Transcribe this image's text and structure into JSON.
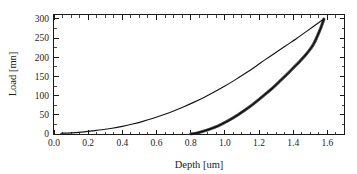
{
  "chart_data": {
    "type": "line",
    "title": "",
    "xlabel": "Depth [um]",
    "ylabel": "Load [mn]",
    "xlim": [
      0.0,
      1.7
    ],
    "ylim": [
      0,
      310
    ],
    "grid": false,
    "legend": "none",
    "x_ticks": [
      "0.0",
      "0.2",
      "0.4",
      "0.6",
      "0.8",
      "1.0",
      "1.2",
      "1.4",
      "1.6"
    ],
    "x_tick_values": [
      0.0,
      0.2,
      0.4,
      0.6,
      0.8,
      1.0,
      1.2,
      1.4,
      1.6
    ],
    "x_minor_step": 0.05,
    "y_ticks": [
      "0",
      "50",
      "100",
      "150",
      "200",
      "250",
      "300"
    ],
    "y_tick_values": [
      0,
      50,
      100,
      150,
      200,
      250,
      300
    ],
    "y_minor_step": 25,
    "series": [
      {
        "name": "loading",
        "x": [
          0.04,
          0.1,
          0.16,
          0.22,
          0.28,
          0.34,
          0.4,
          0.46,
          0.52,
          0.58,
          0.64,
          0.7,
          0.76,
          0.82,
          0.88,
          0.94,
          1.0,
          1.06,
          1.12,
          1.18,
          1.24,
          1.3,
          1.36,
          1.42,
          1.48,
          1.53,
          1.58
        ],
        "values": [
          2,
          3,
          5,
          8,
          11,
          15,
          20,
          26,
          33,
          41,
          50,
          60,
          71,
          83,
          96,
          110,
          125,
          141,
          158,
          176,
          195,
          213,
          231,
          249,
          268,
          284,
          300
        ]
      },
      {
        "name": "unloading",
        "x": [
          0.8,
          0.84,
          0.88,
          0.92,
          0.96,
          1.0,
          1.04,
          1.08,
          1.12,
          1.16,
          1.2,
          1.24,
          1.28,
          1.32,
          1.36,
          1.4,
          1.44,
          1.48,
          1.52,
          1.56,
          1.58
        ],
        "values": [
          0,
          3,
          8,
          14,
          21,
          30,
          40,
          51,
          63,
          76,
          90,
          105,
          120,
          137,
          154,
          172,
          190,
          210,
          235,
          275,
          300
        ]
      }
    ],
    "annotations": []
  },
  "axes": {
    "x_title": "Depth [um]",
    "y_title": "Load [mn]"
  }
}
